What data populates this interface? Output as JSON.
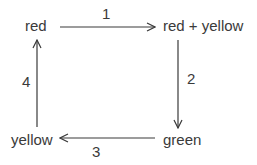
{
  "diagram": {
    "type": "cycle",
    "nodes": [
      {
        "id": "red",
        "label": "red"
      },
      {
        "id": "red_yellow",
        "label": "red + yellow"
      },
      {
        "id": "green",
        "label": "green"
      },
      {
        "id": "yellow",
        "label": "yellow"
      }
    ],
    "edges": [
      {
        "from": "red",
        "to": "red_yellow",
        "label": "1"
      },
      {
        "from": "red_yellow",
        "to": "green",
        "label": "2"
      },
      {
        "from": "green",
        "to": "yellow",
        "label": "3"
      },
      {
        "from": "yellow",
        "to": "red",
        "label": "4"
      }
    ],
    "colors": {
      "stroke": "#3a3a3a",
      "background": "#ffffff"
    }
  }
}
